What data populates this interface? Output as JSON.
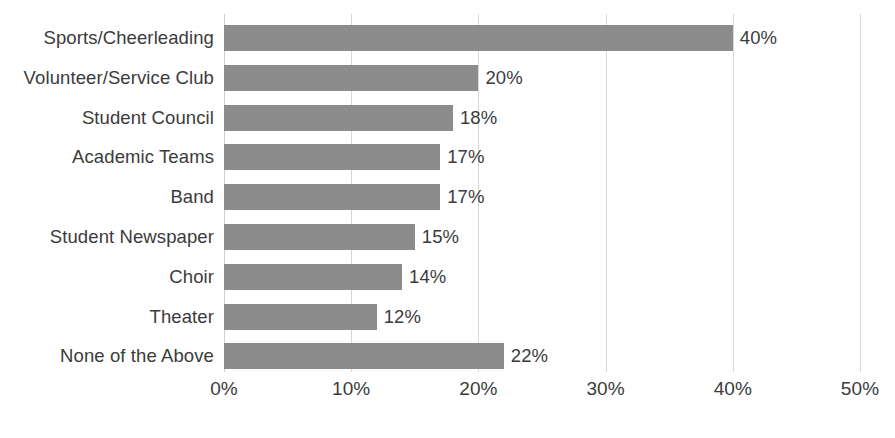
{
  "chart_data": {
    "type": "bar",
    "orientation": "horizontal",
    "title": "",
    "subtitle": "",
    "xlabel": "",
    "ylabel": "",
    "xlim": [
      0,
      50
    ],
    "grid": true,
    "legend": false,
    "legend_position": "none",
    "bar_color": "#8c8c8c",
    "text_color": "#3b3b3b",
    "gridline_color": "#d8d8d8",
    "background_color": "#ffffff",
    "xticks": [
      0,
      10,
      20,
      30,
      40,
      50
    ],
    "xtick_labels": [
      "0%",
      "10%",
      "20%",
      "30%",
      "40%",
      "50%"
    ],
    "categories": [
      "Sports/Cheerleading",
      "Volunteer/Service Club",
      "Student Council",
      "Academic Teams",
      "Band",
      "Student Newspaper",
      "Choir",
      "Theater",
      "None of the Above"
    ],
    "values": [
      40,
      20,
      18,
      17,
      17,
      15,
      14,
      12,
      22
    ],
    "value_labels": [
      "40%",
      "20%",
      "18%",
      "17%",
      "17%",
      "15%",
      "14%",
      "12%",
      "22%"
    ]
  }
}
